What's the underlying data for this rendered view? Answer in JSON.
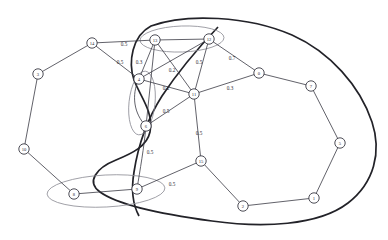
{
  "diagram": {
    "type": "weighted-graph",
    "title": "",
    "node_count": 16,
    "edge_count": 19,
    "cluster_count": 3
  },
  "nodes": [
    {
      "id": "0",
      "label": "0",
      "x": 259,
      "y": 73
    },
    {
      "id": "1",
      "label": "1",
      "x": 314,
      "y": 198
    },
    {
      "id": "2",
      "label": "2",
      "x": 243,
      "y": 206
    },
    {
      "id": "3",
      "label": "3",
      "x": 38,
      "y": 74
    },
    {
      "id": "4",
      "label": "4",
      "x": 139,
      "y": 79
    },
    {
      "id": "5",
      "label": "5",
      "x": 340,
      "y": 143
    },
    {
      "id": "6",
      "label": "6",
      "x": 146,
      "y": 126
    },
    {
      "id": "7",
      "label": "7",
      "x": 311,
      "y": 86
    },
    {
      "id": "8",
      "label": "8",
      "x": 74,
      "y": 194
    },
    {
      "id": "9",
      "label": "9",
      "x": 137,
      "y": 189
    },
    {
      "id": "10",
      "label": "10",
      "x": 24,
      "y": 149
    },
    {
      "id": "11",
      "label": "11",
      "x": 194,
      "y": 94
    },
    {
      "id": "12",
      "label": "12",
      "x": 209,
      "y": 39
    },
    {
      "id": "13",
      "label": "13",
      "x": 155,
      "y": 40
    },
    {
      "id": "14",
      "label": "14",
      "x": 92,
      "y": 43
    },
    {
      "id": "15",
      "label": "15",
      "x": 201,
      "y": 161
    }
  ],
  "edges": [
    {
      "from": "14",
      "to": "13",
      "weight": "0.5",
      "lx": 124,
      "ly": 44
    },
    {
      "from": "14",
      "to": "4",
      "weight": "0.5",
      "lx": 120,
      "ly": 62
    },
    {
      "from": "13",
      "to": "4",
      "weight": "0.3",
      "lx": 139,
      "ly": 62
    },
    {
      "from": "13",
      "to": "11",
      "weight": "0.2",
      "lx": 172,
      "ly": 70
    },
    {
      "from": "12",
      "to": "11",
      "weight": "0.5",
      "lx": 199,
      "ly": 62
    },
    {
      "from": "12",
      "to": "0",
      "weight": "0.7",
      "lx": 232,
      "ly": 58
    },
    {
      "from": "11",
      "to": "0",
      "weight": "0.3",
      "lx": 230,
      "ly": 88
    },
    {
      "from": "4",
      "to": "11",
      "weight": "0.2",
      "lx": 166,
      "ly": 88
    },
    {
      "from": "6",
      "to": "11",
      "weight": "0.5",
      "lx": 166,
      "ly": 111
    },
    {
      "from": "6",
      "to": "9",
      "weight": "0.5",
      "lx": 150,
      "ly": 152
    },
    {
      "from": "11",
      "to": "15",
      "weight": "0.5",
      "lx": 199,
      "ly": 133
    },
    {
      "from": "9",
      "to": "15",
      "weight": "0.5",
      "lx": 172,
      "ly": 184
    },
    {
      "from": "3",
      "to": "14",
      "weight": "",
      "lx": 0,
      "ly": 0
    },
    {
      "from": "3",
      "to": "10",
      "weight": "",
      "lx": 0,
      "ly": 0
    },
    {
      "from": "10",
      "to": "8",
      "weight": "",
      "lx": 0,
      "ly": 0
    },
    {
      "from": "8",
      "to": "9",
      "weight": "",
      "lx": 0,
      "ly": 0
    },
    {
      "from": "0",
      "to": "7",
      "weight": "",
      "lx": 0,
      "ly": 0
    },
    {
      "from": "7",
      "to": "5",
      "weight": "",
      "lx": 0,
      "ly": 0
    },
    {
      "from": "5",
      "to": "1",
      "weight": "",
      "lx": 0,
      "ly": 0
    },
    {
      "from": "1",
      "to": "2",
      "weight": "",
      "lx": 0,
      "ly": 0
    },
    {
      "from": "2",
      "to": "15",
      "weight": "",
      "lx": 0,
      "ly": 0
    },
    {
      "from": "13",
      "to": "12",
      "weight": "",
      "lx": 0,
      "ly": 0
    },
    {
      "from": "4",
      "to": "6",
      "weight": "",
      "lx": 0,
      "ly": 0
    },
    {
      "from": "12",
      "to": "4",
      "weight": "",
      "lx": 0,
      "ly": 0
    },
    {
      "from": "13",
      "to": "6",
      "weight": "",
      "lx": 0,
      "ly": 0
    }
  ],
  "clusters": [
    {
      "name": "cluster-top",
      "members": [
        "13",
        "12"
      ],
      "cx": 182,
      "cy": 39,
      "rx": 42,
      "ry": 13,
      "rot": -2
    },
    {
      "name": "cluster-center-left",
      "members": [
        "4",
        "6"
      ],
      "cx": 142,
      "cy": 103,
      "rx": 13,
      "ry": 32,
      "rot": 6
    },
    {
      "name": "cluster-bottom-left",
      "members": [
        "8",
        "9"
      ],
      "cx": 106,
      "cy": 191,
      "rx": 59,
      "ry": 16,
      "rot": -3
    }
  ],
  "contour": {
    "name": "enclosing-boundary",
    "description": "large dark closed curve spanning the diagram"
  },
  "colors": {
    "node_fill": "#ffffff",
    "node_stroke": "#3a3a44",
    "edge": "#3a3a44",
    "cluster": "#8a8a93",
    "contour": "#222228",
    "background": "#ffffff",
    "text": "#2b2b32"
  }
}
